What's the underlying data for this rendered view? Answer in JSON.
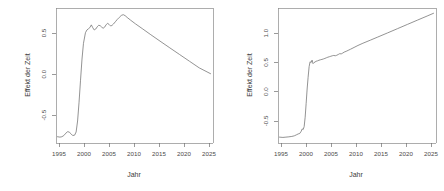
{
  "figure": {
    "background": "#ffffff",
    "line_color": "#777777",
    "axis_color": "#6f6f6f",
    "panels": 2
  },
  "chart_data": [
    {
      "type": "line",
      "panel": "left",
      "title": "",
      "xlabel": "Jahr",
      "ylabel": "Effekt der Zeit",
      "xlim": [
        1993.8,
        2025.8
      ],
      "ylim": [
        -1.0,
        0.72
      ],
      "xticks": [
        1995,
        2000,
        2005,
        2010,
        2015,
        2020,
        2025
      ],
      "xticklabels": [
        "1995",
        "2000",
        "2005",
        "2010",
        "2015",
        "2020",
        "2025"
      ],
      "yticks": [
        -0.5,
        0.0,
        0.5
      ],
      "yticklabels": [
        "-0.5",
        "0.0",
        "0.5"
      ],
      "grid": false,
      "legend": "none",
      "series": [
        {
          "name": "Effekt der Zeit",
          "x": [
            1994.1,
            1994.6,
            1995.0,
            1995.4,
            1995.8,
            1996.2,
            1996.5,
            1996.9,
            1997.2,
            1997.6,
            1997.9,
            1998.2,
            1998.5,
            1998.8,
            1999.1,
            1999.4,
            1999.8,
            2000.1,
            2000.4,
            2000.7,
            2001.0,
            2001.3,
            2001.6,
            2001.9,
            2002.2,
            2002.5,
            2002.8,
            2003.1,
            2003.4,
            2003.7,
            2004.0,
            2004.3,
            2004.6,
            2004.9,
            2005.2,
            2005.5,
            2005.9,
            2006.3,
            2006.7,
            2007.1,
            2007.5,
            2007.9,
            2008.3,
            2009.0,
            2010.0,
            2011.5,
            2013.0,
            2015.0,
            2017.0,
            2019.0,
            2021.0,
            2023.0,
            2025.3
          ],
          "y": [
            -0.92,
            -0.925,
            -0.92,
            -0.905,
            -0.875,
            -0.855,
            -0.862,
            -0.885,
            -0.905,
            -0.9,
            -0.86,
            -0.72,
            -0.48,
            -0.2,
            0.07,
            0.27,
            0.405,
            0.44,
            0.455,
            0.47,
            0.505,
            0.468,
            0.44,
            0.452,
            0.48,
            0.5,
            0.495,
            0.477,
            0.462,
            0.475,
            0.505,
            0.525,
            0.512,
            0.492,
            0.497,
            0.515,
            0.545,
            0.575,
            0.6,
            0.625,
            0.635,
            0.622,
            0.6,
            0.565,
            0.518,
            0.452,
            0.385,
            0.298,
            0.212,
            0.127,
            0.042,
            -0.043,
            -0.117
          ]
        }
      ]
    },
    {
      "type": "line",
      "panel": "right",
      "title": "",
      "xlabel": "Jahr",
      "ylabel": "Effekt der Zeit",
      "xlim": [
        1993.8,
        2025.8
      ],
      "ylim": [
        -1.0,
        1.3
      ],
      "xticks": [
        1995,
        2000,
        2005,
        2010,
        2015,
        2020,
        2025
      ],
      "xticklabels": [
        "1995",
        "2000",
        "2005",
        "2010",
        "2015",
        "2020",
        "2025"
      ],
      "yticks": [
        -0.5,
        0.0,
        0.5,
        1.0
      ],
      "yticklabels": [
        "-0.5",
        "0.0",
        "0.5",
        "1.0"
      ],
      "grid": false,
      "legend": "none",
      "series": [
        {
          "name": "Effekt der Zeit",
          "x": [
            1994.1,
            1994.8,
            1995.4,
            1996.0,
            1996.6,
            1997.1,
            1997.5,
            1997.9,
            1998.2,
            1998.5,
            1998.7,
            1998.9,
            1999.1,
            1999.3,
            1999.5,
            1999.7,
            1999.9,
            2000.1,
            2000.3,
            2000.5,
            2000.7,
            2000.9,
            2001.1,
            2001.3,
            2001.5,
            2001.8,
            2002.1,
            2002.4,
            2002.7,
            2003.0,
            2003.3,
            2003.6,
            2003.9,
            2004.2,
            2004.5,
            2004.8,
            2005.1,
            2005.4,
            2005.7,
            2006.0,
            2006.3,
            2006.6,
            2006.9,
            2007.2,
            2007.6,
            2008.0,
            2008.5,
            2009.2,
            2010.0,
            2011.0,
            2012.5,
            2014.0,
            2016.0,
            2018.0,
            2020.0,
            2022.0,
            2024.0,
            2025.3
          ],
          "y": [
            -0.9,
            -0.905,
            -0.9,
            -0.895,
            -0.888,
            -0.878,
            -0.862,
            -0.845,
            -0.838,
            -0.8,
            -0.76,
            -0.77,
            -0.72,
            -0.56,
            -0.33,
            -0.08,
            0.12,
            0.3,
            0.385,
            0.37,
            0.412,
            0.352,
            0.37,
            0.38,
            0.392,
            0.4,
            0.41,
            0.418,
            0.424,
            0.432,
            0.441,
            0.452,
            0.462,
            0.47,
            0.478,
            0.486,
            0.492,
            0.486,
            0.495,
            0.508,
            0.522,
            0.518,
            0.532,
            0.548,
            0.562,
            0.578,
            0.598,
            0.628,
            0.662,
            0.7,
            0.752,
            0.805,
            0.876,
            0.948,
            1.02,
            1.092,
            1.163,
            1.21
          ]
        }
      ]
    }
  ]
}
